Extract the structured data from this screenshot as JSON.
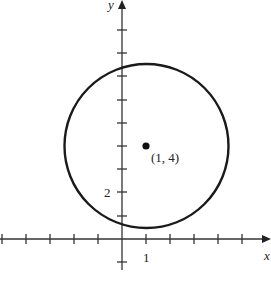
{
  "diagram": {
    "type": "coordinate-plane-circle",
    "axes": {
      "x_label": "x",
      "y_label": "y",
      "x_tick_label": "1",
      "y_tick_label": "2",
      "origin_px": [
        122,
        239
      ],
      "unit_px": 23.7
    },
    "circle": {
      "center": [
        1,
        4
      ],
      "center_label": "(1, 4)",
      "radius_units": 3.45,
      "stroke": "#1a1a1a"
    },
    "colors": {
      "axis": "#333333",
      "ink": "#1a1a1a",
      "background": "#ffffff"
    }
  }
}
